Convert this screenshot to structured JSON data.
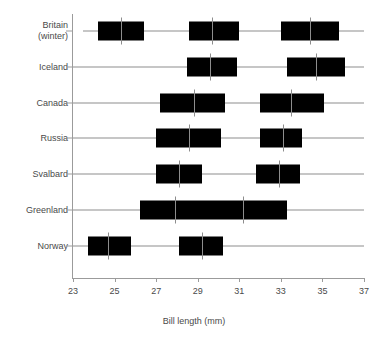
{
  "chart_data": {
    "type": "box",
    "title": "",
    "xlabel": "Bill length (mm)",
    "ylabel": "",
    "xlim": [
      23,
      37
    ],
    "xticks": [
      23,
      25,
      27,
      29,
      31,
      33,
      35,
      37
    ],
    "xtick_labels": [
      "23",
      "25",
      "27",
      "29",
      "31",
      "33",
      "35",
      "37"
    ],
    "grid": false,
    "legend": "none",
    "orientation": "horizontal",
    "categories": [
      "Britain\n(winter)",
      "Iceland",
      "Canada",
      "Russia",
      "Svalbard",
      "Greenland",
      "Norway"
    ],
    "groups": [
      {
        "category": "Britain (winter)",
        "whisker_min": 23.5,
        "whisker_max": 37.0,
        "boxes": [
          {
            "q1": 24.2,
            "median": 25.3,
            "q3": 26.4
          },
          {
            "q1": 28.6,
            "median": 29.7,
            "q3": 31.0
          },
          {
            "q1": 33.0,
            "median": 34.4,
            "q3": 35.8
          }
        ]
      },
      {
        "category": "Iceland",
        "whisker_min": 23.0,
        "whisker_max": 37.0,
        "boxes": [
          {
            "q1": 28.5,
            "median": 29.6,
            "q3": 30.9
          },
          {
            "q1": 33.3,
            "median": 34.7,
            "q3": 36.1
          }
        ]
      },
      {
        "category": "Canada",
        "whisker_min": 23.0,
        "whisker_max": 37.0,
        "boxes": [
          {
            "q1": 27.2,
            "median": 28.8,
            "q3": 30.3
          },
          {
            "q1": 32.0,
            "median": 33.5,
            "q3": 35.1
          }
        ]
      },
      {
        "category": "Russia",
        "whisker_min": 23.0,
        "whisker_max": 37.0,
        "boxes": [
          {
            "q1": 27.0,
            "median": 28.6,
            "q3": 30.1
          },
          {
            "q1": 32.0,
            "median": 33.1,
            "q3": 34.0
          }
        ]
      },
      {
        "category": "Svalbard",
        "whisker_min": 23.0,
        "whisker_max": 37.0,
        "boxes": [
          {
            "q1": 27.0,
            "median": 28.1,
            "q3": 29.2
          },
          {
            "q1": 31.8,
            "median": 32.9,
            "q3": 33.9
          }
        ]
      },
      {
        "category": "Greenland",
        "whisker_min": 23.0,
        "whisker_max": 37.0,
        "boxes": [
          {
            "q1": 26.2,
            "median": 27.9,
            "q3": 29.7
          },
          {
            "q1": 29.7,
            "median": 31.2,
            "q3": 33.3
          }
        ]
      },
      {
        "category": "Norway",
        "whisker_min": 23.0,
        "whisker_max": 37.0,
        "boxes": [
          {
            "q1": 23.7,
            "median": 24.7,
            "q3": 25.8
          },
          {
            "q1": 28.1,
            "median": 29.2,
            "q3": 30.2
          }
        ]
      }
    ],
    "colors": {
      "box_fill": "#000000",
      "axis": "#9b9b9b",
      "spine": "#8d8d8d",
      "text": "#4a4a4a",
      "background": "#ffffff"
    }
  }
}
